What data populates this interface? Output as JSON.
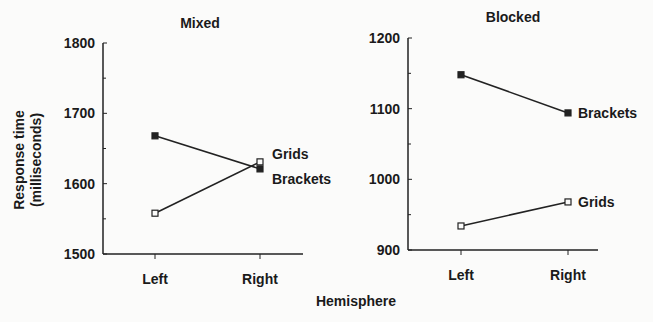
{
  "figure": {
    "shared_xlabel": "Hemisphere",
    "shared_ylabel_line1": "Response time",
    "shared_ylabel_line2": "(milliseconds)"
  },
  "chart_data": [
    {
      "type": "line",
      "title": "Mixed",
      "xlabel": "Hemisphere",
      "ylabel": "Response time (milliseconds)",
      "categories": [
        "Left",
        "Right"
      ],
      "ylim": [
        1500,
        1800
      ],
      "yticks": [
        1500,
        1600,
        1700,
        1800
      ],
      "grid": false,
      "legend": "inline labels at right end of lines",
      "series": [
        {
          "name": "Grids",
          "marker": "open-square",
          "values": [
            1558,
            1631
          ]
        },
        {
          "name": "Brackets",
          "marker": "filled-square",
          "values": [
            1668,
            1621
          ]
        }
      ]
    },
    {
      "type": "line",
      "title": "Blocked",
      "xlabel": "Hemisphere",
      "ylabel": "Response time (milliseconds)",
      "categories": [
        "Left",
        "Right"
      ],
      "ylim": [
        900,
        1200
      ],
      "yticks": [
        900,
        1000,
        1100,
        1200
      ],
      "grid": false,
      "legend": "inline labels at right end of lines",
      "series": [
        {
          "name": "Brackets",
          "marker": "filled-square",
          "values": [
            1148,
            1094
          ]
        },
        {
          "name": "Grids",
          "marker": "open-square",
          "values": [
            934,
            968
          ]
        }
      ]
    }
  ]
}
